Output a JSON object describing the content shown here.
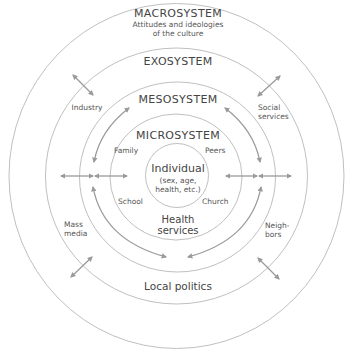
{
  "colors": {
    "ring_stroke": "#b5b5b5",
    "arrow": "#9a9a9a",
    "text": "#555555",
    "background": "#ffffff"
  },
  "systems": {
    "macrosystem": {
      "label": "MACROSYSTEM",
      "description_line1": "Attitudes and ideologies",
      "description_line2": "of the culture"
    },
    "exosystem": {
      "label": "EXOSYSTEM",
      "items": {
        "industry": "Industry",
        "social_services_line1": "Social",
        "social_services_line2": "services",
        "mass_media_line1": "Mass",
        "mass_media_line2": "media",
        "neighbors_line1": "Neigh-",
        "neighbors_line2": "bors",
        "local_politics": "Local politics"
      }
    },
    "mesosystem": {
      "label": "MESOSYSTEM"
    },
    "microsystem": {
      "label": "MICROSYSTEM",
      "items": {
        "family": "Family",
        "peers": "Peers",
        "school": "School",
        "church": "Church",
        "health_services_line1": "Health",
        "health_services_line2": "services"
      }
    },
    "individual": {
      "label": "Individual",
      "details_line1": "(sex, age,",
      "details_line2": "health, etc.)"
    }
  },
  "icons": {
    "bidirectional_arrow": "double-headed-arrow",
    "curved_arrow": "curved-arrow"
  }
}
